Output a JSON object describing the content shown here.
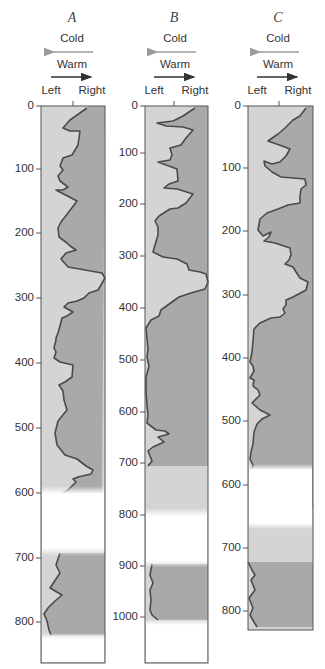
{
  "columns": [
    {
      "id": "A",
      "title": "A",
      "legend": {
        "cold": "Cold",
        "warm": "Warm",
        "left": "Left",
        "right": "Right"
      },
      "ticks": [
        "0",
        "100",
        "200",
        "300",
        "400",
        "500",
        "600",
        "700",
        "800"
      ],
      "depth_max": 850,
      "gaps": [
        [
          585,
          685
        ],
        [
          825,
          850
        ]
      ],
      "curve_description": "Coiling-ratio style record: alternating cold (left) / warm (right) excursions"
    },
    {
      "id": "B",
      "title": "B",
      "legend": {
        "cold": "Cold",
        "warm": "Warm",
        "left": "Left",
        "right": "Right"
      },
      "ticks": [
        "0",
        "100",
        "200",
        "300",
        "400",
        "500",
        "600",
        "700",
        "800",
        "900",
        "1000"
      ],
      "depth_max": 1090,
      "gaps": [
        [
          795,
          890
        ],
        [
          1030,
          1090
        ]
      ]
    },
    {
      "id": "C",
      "title": "C",
      "legend": {
        "cold": "Cold",
        "warm": "Warm",
        "left": "Left",
        "right": "Right"
      },
      "ticks": [
        "0",
        "100",
        "200",
        "300",
        "400",
        "500",
        "600",
        "700",
        "800"
      ],
      "depth_max": 825,
      "gaps": [
        [
          565,
          655
        ]
      ]
    }
  ],
  "colors": {
    "cold_fill": "#d4d4d4",
    "warm_fill": "#a9a9a9",
    "curve": "#4a4a4a",
    "frame": "#555555",
    "cold_arrow": "#9a9a9a",
    "warm_arrow": "#333333"
  }
}
